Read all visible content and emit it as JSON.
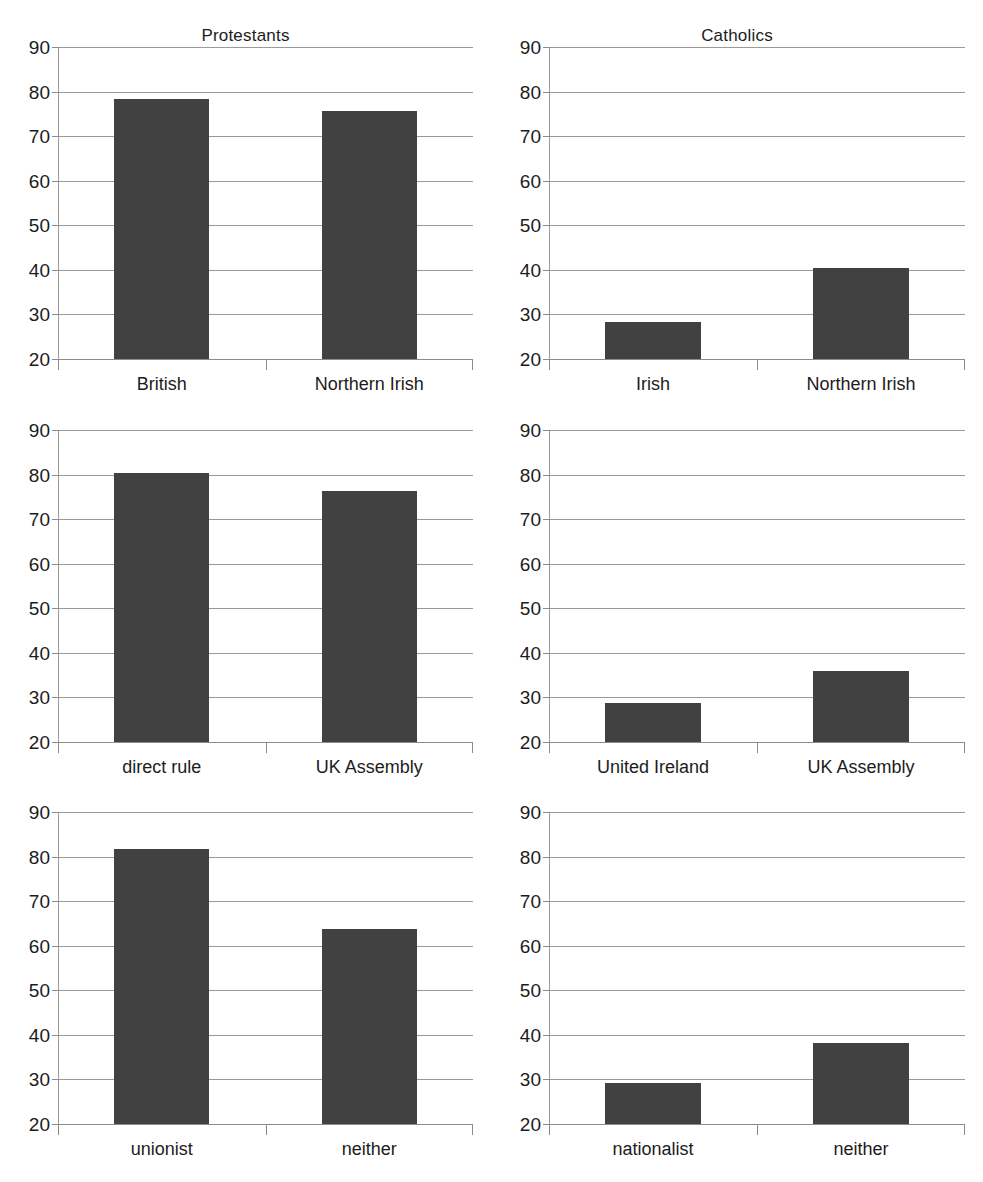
{
  "figure": {
    "background_color": "#ffffff",
    "bar_color": "#414141",
    "gridline_color": "#9a9a9a",
    "text_color": "#1c1c1c"
  },
  "chart_data": [
    {
      "type": "bar",
      "title": "Protestants",
      "categories": [
        "British",
        "Northern Irish"
      ],
      "values": [
        78.3,
        75.7
      ],
      "xlabel": "",
      "ylabel": "",
      "ylim": [
        20,
        90
      ],
      "yticks": [
        20,
        30,
        40,
        50,
        60,
        70,
        80,
        90
      ],
      "ytick_labels": [
        "20",
        "30",
        "40",
        "50",
        "60",
        "70",
        "80",
        "90"
      ],
      "grid": true,
      "legend": "none",
      "position": "top-left"
    },
    {
      "type": "bar",
      "title": "Catholics",
      "categories": [
        "Irish",
        "Northern Irish"
      ],
      "values": [
        28.4,
        40.4
      ],
      "xlabel": "",
      "ylabel": "",
      "ylim": [
        20,
        90
      ],
      "yticks": [
        20,
        30,
        40,
        50,
        60,
        70,
        80,
        90
      ],
      "ytick_labels": [
        "20",
        "30",
        "40",
        "50",
        "60",
        "70",
        "80",
        "90"
      ],
      "grid": true,
      "legend": "none",
      "position": "top-right"
    },
    {
      "type": "bar",
      "title": "",
      "categories": [
        "direct rule",
        "UK Assembly"
      ],
      "values": [
        80.3,
        76.3
      ],
      "xlabel": "",
      "ylabel": "",
      "ylim": [
        20,
        90
      ],
      "yticks": [
        20,
        30,
        40,
        50,
        60,
        70,
        80,
        90
      ],
      "ytick_labels": [
        "20",
        "30",
        "40",
        "50",
        "60",
        "70",
        "80",
        "90"
      ],
      "grid": true,
      "legend": "none",
      "position": "middle-left"
    },
    {
      "type": "bar",
      "title": "",
      "categories": [
        "United Ireland",
        "UK Assembly"
      ],
      "values": [
        28.8,
        35.9
      ],
      "xlabel": "",
      "ylabel": "",
      "ylim": [
        20,
        90
      ],
      "yticks": [
        20,
        30,
        40,
        50,
        60,
        70,
        80,
        90
      ],
      "ytick_labels": [
        "20",
        "30",
        "40",
        "50",
        "60",
        "70",
        "80",
        "90"
      ],
      "grid": true,
      "legend": "none",
      "position": "middle-right"
    },
    {
      "type": "bar",
      "title": "",
      "categories": [
        "unionist",
        "neither"
      ],
      "values": [
        81.7,
        63.7
      ],
      "xlabel": "",
      "ylabel": "",
      "ylim": [
        20,
        90
      ],
      "yticks": [
        20,
        30,
        40,
        50,
        60,
        70,
        80,
        90
      ],
      "ytick_labels": [
        "20",
        "30",
        "40",
        "50",
        "60",
        "70",
        "80",
        "90"
      ],
      "grid": true,
      "legend": "none",
      "position": "bottom-left"
    },
    {
      "type": "bar",
      "title": "",
      "categories": [
        "nationalist",
        "neither"
      ],
      "values": [
        29.3,
        38.1
      ],
      "xlabel": "",
      "ylabel": "",
      "ylim": [
        20,
        90
      ],
      "yticks": [
        20,
        30,
        40,
        50,
        60,
        70,
        80,
        90
      ],
      "ytick_labels": [
        "20",
        "30",
        "40",
        "50",
        "60",
        "70",
        "80",
        "90"
      ],
      "grid": true,
      "legend": "none",
      "position": "bottom-right"
    }
  ]
}
